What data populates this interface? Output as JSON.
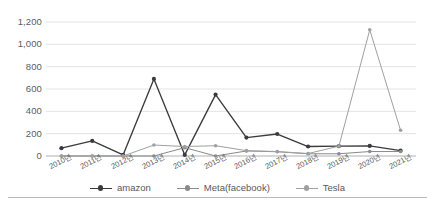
{
  "chart_data": {
    "type": "line",
    "title": "",
    "subtitle": "",
    "xlabel": "",
    "ylabel": "",
    "categories": [
      "2010년",
      "2011년",
      "2012년",
      "2013년",
      "2014년",
      "2015년",
      "2016년",
      "2017년",
      "2018년",
      "2019년",
      "2020년",
      "2021년"
    ],
    "series": [
      {
        "name": "amazon",
        "color": "#3b3b3d",
        "values": [
          70,
          135,
          10,
          690,
          10,
          550,
          165,
          197,
          85,
          88,
          90,
          48
        ]
      },
      {
        "name": "Meta(facebook)",
        "color": "#8a8a8c",
        "values": [
          0,
          0,
          0,
          0,
          75,
          0,
          45,
          38,
          20,
          20,
          40,
          40
        ]
      },
      {
        "name": "Tesla",
        "color": "#a0a0a2",
        "values": [
          0,
          0,
          0,
          98,
          85,
          92,
          48,
          40,
          22,
          88,
          1130,
          230
        ]
      }
    ],
    "ylim": [
      0,
      1200
    ],
    "ytick_values": [
      0,
      200,
      400,
      600,
      800,
      1000,
      1200
    ],
    "ytick_labels": [
      "0",
      "200",
      "400",
      "600",
      "800",
      "1,000",
      "1,200"
    ],
    "grid": true,
    "grid_axis": "y",
    "grid_color": "#e3e3e5",
    "axis_color": "#b0b0b2",
    "legend": {
      "position": "bottom",
      "entries": [
        {
          "label": "amazon",
          "color": "#3b3b3d"
        },
        {
          "label": "Meta(facebook)",
          "color": "#8a8a8c"
        },
        {
          "label": "Tesla",
          "color": "#a0a0a2"
        }
      ]
    },
    "markers": "circle",
    "background": "#ffffff"
  }
}
